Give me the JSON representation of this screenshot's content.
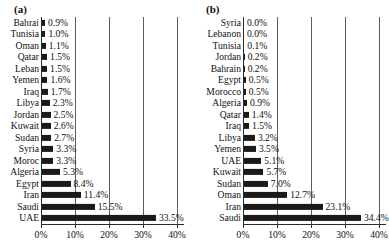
{
  "figure": {
    "panels": [
      {
        "key": "a",
        "label": "(a)",
        "geometry": {
          "axis_left": 41,
          "px_per_percent": 3.4,
          "label_right": 39,
          "value_gap": 3,
          "grid_top": 0,
          "rows": 18
        },
        "chart_data": {
          "type": "bar",
          "orientation": "horizontal",
          "title": "(a)",
          "xlabel": "",
          "ylabel": "",
          "xlim": [
            0,
            42
          ],
          "grid": true,
          "legend": "none",
          "xticks": [
            "0%",
            "10%",
            "20%",
            "30%",
            "40%"
          ],
          "xtick_values": [
            0,
            10,
            20,
            30,
            40
          ],
          "categories": [
            "Bahrai",
            "Tunisia",
            "Oman",
            "Qatar",
            "Leban",
            "Yemen",
            "Iraq",
            "Libya",
            "Jordan",
            "Kuwait",
            "Sudan",
            "Syria",
            "Moroc",
            "Algeria",
            "Egypt",
            "Iran",
            "Saudi",
            "UAE"
          ],
          "values": [
            0.9,
            1.0,
            1.1,
            1.5,
            1.5,
            1.6,
            1.7,
            2.3,
            2.5,
            2.6,
            2.7,
            3.3,
            3.3,
            5.3,
            8.4,
            11.4,
            15.5,
            33.5
          ],
          "value_labels": [
            "0.9%",
            "1.0%",
            "1.1%",
            "1.5%",
            "1.5%",
            "1.6%",
            "1.7%",
            "2.3%",
            "2.5%",
            "2.6%",
            "2.7%",
            "3.3%",
            "3.3%",
            "5.3%",
            "8.4%",
            "11.4%",
            "15.5%",
            "33.5%"
          ],
          "bar_color": "#1a1a1a"
        }
      },
      {
        "key": "b",
        "label": "(b)",
        "geometry": {
          "axis_left": 49,
          "px_per_percent": 3.4,
          "label_right": 47,
          "value_gap": 3,
          "grid_top": 0,
          "rows": 18
        },
        "chart_data": {
          "type": "bar",
          "orientation": "horizontal",
          "title": "(b)",
          "xlabel": "",
          "ylabel": "",
          "xlim": [
            0,
            42
          ],
          "grid": true,
          "legend": "none",
          "xticks": [
            "0%",
            "10%",
            "20%",
            "30%",
            "40%"
          ],
          "xtick_values": [
            0,
            10,
            20,
            30,
            40
          ],
          "categories": [
            "Syria",
            "Lebanon",
            "Tunisia",
            "Jordan",
            "Bahrain",
            "Egypt",
            "Morocco",
            "Algeria",
            "Qatar",
            "Iraq",
            "Libya",
            "Yemen",
            "UAE",
            "Kuwait",
            "Sudan",
            "Oman",
            "Iran",
            "Saudi"
          ],
          "values": [
            0.0,
            0.0,
            0.1,
            0.2,
            0.2,
            0.5,
            0.5,
            0.9,
            1.4,
            1.5,
            3.2,
            3.5,
            5.1,
            5.7,
            7.0,
            12.7,
            23.1,
            34.4
          ],
          "value_labels": [
            "0.0%",
            "0.0%",
            "0.1%",
            "0.2%",
            "0.2%",
            "0.5%",
            "0.5%",
            "0.9%",
            "1.4%",
            "1.5%",
            "3.2%",
            "3.5%",
            "5.1%",
            "5.7%",
            "7.0%",
            "12.7%",
            "23.1%",
            "34.4%"
          ],
          "bar_color": "#1a1a1a"
        }
      }
    ]
  }
}
